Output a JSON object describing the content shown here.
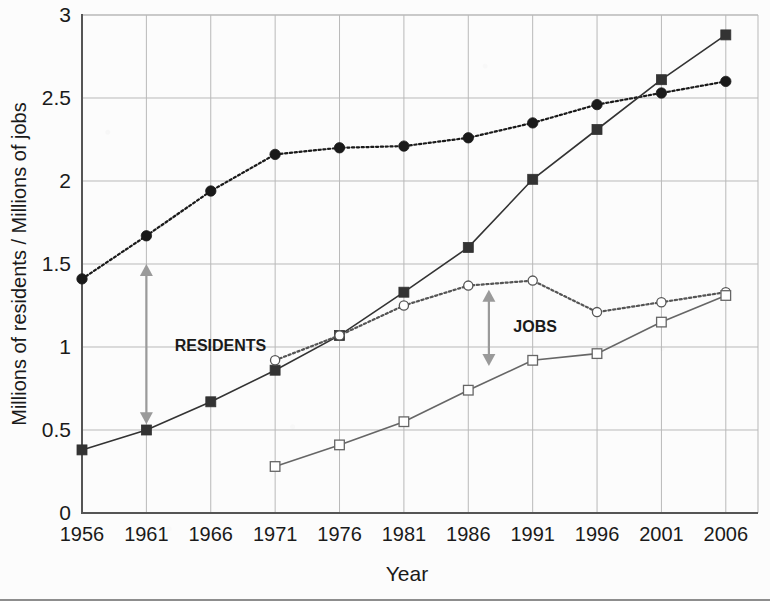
{
  "chart_data": {
    "type": "line",
    "title": "",
    "xlabel": "Year",
    "ylabel": "Millions of residents / Millions of jobs",
    "x": [
      1956,
      1961,
      1966,
      1971,
      1976,
      1981,
      1986,
      1991,
      1996,
      2001,
      2006
    ],
    "xtick_labels": [
      "1956",
      "1961",
      "1966",
      "1971",
      "1976",
      "1981",
      "1986",
      "1991",
      "1996",
      "2001",
      "2006"
    ],
    "ytick_labels": [
      "0",
      "0.5",
      "1",
      "1.5",
      "2",
      "2.5",
      "3"
    ],
    "yticks": [
      0,
      0.5,
      1,
      1.5,
      2,
      2.5,
      3
    ],
    "xlim": [
      1956,
      2008.5
    ],
    "ylim": [
      0,
      3
    ],
    "grid": true,
    "legend": "none",
    "series": [
      {
        "name": "residents-upper",
        "style": "dotted",
        "marker": "filled-circle",
        "color": "#1a1a1a",
        "x": [
          1956,
          1961,
          1966,
          1971,
          1976,
          1981,
          1986,
          1991,
          1996,
          2001,
          2006
        ],
        "values": [
          1.41,
          1.67,
          1.94,
          2.16,
          2.2,
          2.21,
          2.26,
          2.35,
          2.46,
          2.53,
          2.6
        ]
      },
      {
        "name": "residents-lower",
        "style": "solid",
        "marker": "filled-square",
        "color": "#333333",
        "x": [
          1956,
          1961,
          1966,
          1971,
          1976,
          1981,
          1986,
          1991,
          1996,
          2001,
          2006
        ],
        "values": [
          0.38,
          0.5,
          0.67,
          0.86,
          1.07,
          1.33,
          1.6,
          2.01,
          2.31,
          2.61,
          2.88
        ]
      },
      {
        "name": "jobs-upper",
        "style": "dotted",
        "marker": "open-circle",
        "color": "#555555",
        "x": [
          1971,
          1976,
          1981,
          1986,
          1991,
          1996,
          2001,
          2006
        ],
        "values": [
          0.92,
          1.07,
          1.25,
          1.37,
          1.4,
          1.21,
          1.27,
          1.33
        ]
      },
      {
        "name": "jobs-lower",
        "style": "solid",
        "marker": "open-square",
        "color": "#666666",
        "x": [
          1971,
          1976,
          1981,
          1986,
          1991,
          1996,
          2001,
          2006
        ],
        "values": [
          0.28,
          0.41,
          0.55,
          0.74,
          0.92,
          0.96,
          1.15,
          1.31
        ]
      }
    ],
    "annotations": [
      {
        "name": "residents",
        "label": "RESIDENTS",
        "arrow": "double-vertical",
        "arrow_x": 1961,
        "arrow_y_top": 1.5,
        "arrow_y_bottom": 0.535,
        "label_x": 1963.2,
        "label_y": 1.0,
        "color": "#9a9a9a"
      },
      {
        "name": "jobs",
        "label": "JOBS",
        "arrow": "double-vertical",
        "arrow_x": 1987.6,
        "arrow_y_top": 1.345,
        "arrow_y_bottom": 0.885,
        "label_x": 1989.5,
        "label_y": 1.115,
        "color": "#9a9a9a"
      }
    ],
    "axis_colors": {
      "axis_line": "#555555",
      "grid_line": "#b9b9b9",
      "text": "#1a1a1a"
    }
  }
}
